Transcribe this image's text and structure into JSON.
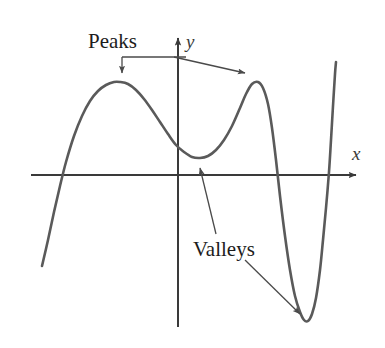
{
  "figure": {
    "background_color": "#ffffff",
    "curve_color": "#5a5a5a",
    "axis_color": "#3a3a3a",
    "annotation_color": "#4a4a4a",
    "label_color": "#1c1c1c"
  },
  "axes": {
    "x_label": "x",
    "y_label": "y",
    "x_axis": {
      "y": 175,
      "x_start": 31,
      "x_end": 362
    },
    "y_axis": {
      "x": 178,
      "y_start": 32,
      "y_end": 327
    }
  },
  "annotations": [
    {
      "id": "peaks",
      "label": "Peaks",
      "label_x": 88,
      "label_y": 48,
      "targets": [
        {
          "name": "left-peak",
          "x": 122,
          "y": 80
        },
        {
          "name": "right-peak",
          "x": 250,
          "y": 80
        }
      ]
    },
    {
      "id": "valleys",
      "label": "Valleys",
      "label_x": 193,
      "label_y": 256,
      "targets": [
        {
          "name": "left-valley",
          "x": 199,
          "y": 162
        },
        {
          "name": "right-valley",
          "x": 304,
          "y": 318
        }
      ]
    }
  ],
  "chart_data": {
    "type": "line",
    "title": "",
    "xlabel": "x",
    "ylabel": "y",
    "grid": false,
    "legend": null,
    "axis_crossings_x": [
      60,
      277,
      330
    ],
    "critical_points": [
      {
        "type": "peak",
        "label": "local maximum",
        "x_px": 120,
        "y_px": 82
      },
      {
        "type": "valley",
        "label": "local minimum",
        "x_px": 200,
        "y_px": 158
      },
      {
        "type": "peak",
        "label": "local maximum",
        "x_px": 252,
        "y_px": 82
      },
      {
        "type": "valley",
        "label": "local minimum",
        "x_px": 307,
        "y_px": 321
      }
    ],
    "curve_points_px": [
      [
        42,
        266
      ],
      [
        48,
        240
      ],
      [
        54,
        212
      ],
      [
        60,
        186
      ],
      [
        66,
        162
      ],
      [
        74,
        136
      ],
      [
        82,
        116
      ],
      [
        90,
        101
      ],
      [
        98,
        91
      ],
      [
        106,
        85
      ],
      [
        114,
        82
      ],
      [
        120,
        82
      ],
      [
        128,
        84
      ],
      [
        136,
        90
      ],
      [
        144,
        99
      ],
      [
        152,
        110
      ],
      [
        160,
        122
      ],
      [
        168,
        134
      ],
      [
        176,
        145
      ],
      [
        184,
        152
      ],
      [
        192,
        157
      ],
      [
        200,
        158
      ],
      [
        208,
        156
      ],
      [
        216,
        150
      ],
      [
        224,
        140
      ],
      [
        232,
        126
      ],
      [
        240,
        108
      ],
      [
        246,
        94
      ],
      [
        252,
        84
      ],
      [
        258,
        82
      ],
      [
        263,
        88
      ],
      [
        268,
        104
      ],
      [
        272,
        128
      ],
      [
        276,
        160
      ],
      [
        280,
        196
      ],
      [
        285,
        236
      ],
      [
        290,
        270
      ],
      [
        295,
        296
      ],
      [
        300,
        312
      ],
      [
        304,
        320
      ],
      [
        308,
        321
      ],
      [
        312,
        314
      ],
      [
        316,
        298
      ],
      [
        320,
        270
      ],
      [
        323,
        240
      ],
      [
        326,
        208
      ],
      [
        329,
        172
      ],
      [
        331,
        140
      ],
      [
        333,
        106
      ],
      [
        335,
        74
      ],
      [
        336,
        62
      ]
    ]
  }
}
